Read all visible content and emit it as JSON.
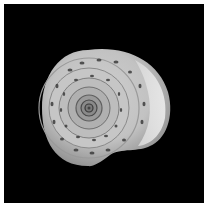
{
  "image": {
    "subject": "snail shell, apical view",
    "background": "#000000",
    "border": "#ffffff",
    "shell_colors": {
      "light": "#e6e6e6",
      "mid": "#b4b4b4",
      "dark": "#5a5a5a",
      "spot": "#3c3c3c"
    }
  }
}
